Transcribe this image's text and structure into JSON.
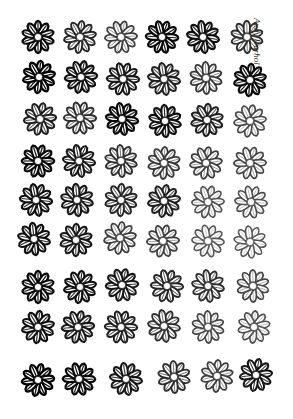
{
  "artwork": {
    "description": "Grid of black-and-white daisy/flower prints of varying ink density",
    "background": "#ffffff",
    "signature": "Andy Warhol",
    "rows": 9,
    "columns": 6,
    "flowers": [
      {
        "row": 0,
        "x": 38,
        "y": 37,
        "ink": 0.95
      },
      {
        "row": 0,
        "x": 80,
        "y": 37,
        "ink": 0.75
      },
      {
        "row": 0,
        "x": 121,
        "y": 37,
        "ink": 0.6
      },
      {
        "row": 0,
        "x": 162,
        "y": 37,
        "ink": 0.95
      },
      {
        "row": 0,
        "x": 203,
        "y": 37,
        "ink": 0.9
      },
      {
        "row": 0,
        "x": 247,
        "y": 37,
        "ink": 0.7
      },
      {
        "row": 1,
        "x": 39,
        "y": 77,
        "ink": 1.0
      },
      {
        "row": 1,
        "x": 81,
        "y": 77,
        "ink": 0.9
      },
      {
        "row": 1,
        "x": 123,
        "y": 79,
        "ink": 0.85
      },
      {
        "row": 1,
        "x": 164,
        "y": 79,
        "ink": 0.8
      },
      {
        "row": 1,
        "x": 206,
        "y": 78,
        "ink": 0.65
      },
      {
        "row": 1,
        "x": 250,
        "y": 80,
        "ink": 0.95
      },
      {
        "row": 2,
        "x": 40,
        "y": 119,
        "ink": 0.8
      },
      {
        "row": 2,
        "x": 80,
        "y": 118,
        "ink": 0.7
      },
      {
        "row": 2,
        "x": 122,
        "y": 119,
        "ink": 0.95
      },
      {
        "row": 2,
        "x": 165,
        "y": 121,
        "ink": 0.9
      },
      {
        "row": 2,
        "x": 207,
        "y": 120,
        "ink": 0.8
      },
      {
        "row": 2,
        "x": 250,
        "y": 121,
        "ink": 0.55
      },
      {
        "row": 3,
        "x": 38,
        "y": 161,
        "ink": 0.95
      },
      {
        "row": 3,
        "x": 79,
        "y": 161,
        "ink": 0.85
      },
      {
        "row": 3,
        "x": 121,
        "y": 161,
        "ink": 0.7
      },
      {
        "row": 3,
        "x": 164,
        "y": 163,
        "ink": 0.65
      },
      {
        "row": 3,
        "x": 206,
        "y": 163,
        "ink": 0.6
      },
      {
        "row": 3,
        "x": 250,
        "y": 163,
        "ink": 0.55
      },
      {
        "row": 4,
        "x": 36,
        "y": 200,
        "ink": 0.9
      },
      {
        "row": 4,
        "x": 77,
        "y": 200,
        "ink": 0.85
      },
      {
        "row": 4,
        "x": 121,
        "y": 200,
        "ink": 0.75
      },
      {
        "row": 4,
        "x": 164,
        "y": 201,
        "ink": 0.8
      },
      {
        "row": 4,
        "x": 208,
        "y": 202,
        "ink": 0.5
      },
      {
        "row": 4,
        "x": 251,
        "y": 202,
        "ink": 0.5
      },
      {
        "row": 5,
        "x": 34,
        "y": 239,
        "ink": 0.9
      },
      {
        "row": 5,
        "x": 76,
        "y": 240,
        "ink": 0.85
      },
      {
        "row": 5,
        "x": 120,
        "y": 238,
        "ink": 0.6
      },
      {
        "row": 5,
        "x": 163,
        "y": 241,
        "ink": 0.6
      },
      {
        "row": 5,
        "x": 208,
        "y": 241,
        "ink": 0.45
      },
      {
        "row": 5,
        "x": 250,
        "y": 242,
        "ink": 0.45
      },
      {
        "row": 6,
        "x": 38,
        "y": 287,
        "ink": 0.95
      },
      {
        "row": 6,
        "x": 80,
        "y": 287,
        "ink": 0.9
      },
      {
        "row": 6,
        "x": 122,
        "y": 285,
        "ink": 0.85
      },
      {
        "row": 6,
        "x": 167,
        "y": 286,
        "ink": 0.75
      },
      {
        "row": 6,
        "x": 208,
        "y": 286,
        "ink": 0.7
      },
      {
        "row": 6,
        "x": 253,
        "y": 286,
        "ink": 0.55
      },
      {
        "row": 7,
        "x": 38,
        "y": 327,
        "ink": 0.9
      },
      {
        "row": 7,
        "x": 78,
        "y": 327,
        "ink": 0.85
      },
      {
        "row": 7,
        "x": 121,
        "y": 327,
        "ink": 0.8
      },
      {
        "row": 7,
        "x": 164,
        "y": 326,
        "ink": 0.7
      },
      {
        "row": 7,
        "x": 208,
        "y": 327,
        "ink": 0.55
      },
      {
        "row": 7,
        "x": 254,
        "y": 327,
        "ink": 0.5
      },
      {
        "row": 8,
        "x": 38,
        "y": 380,
        "ink": 1.0
      },
      {
        "row": 8,
        "x": 79,
        "y": 379,
        "ink": 0.95
      },
      {
        "row": 8,
        "x": 126,
        "y": 379,
        "ink": 0.85
      },
      {
        "row": 8,
        "x": 174,
        "y": 377,
        "ink": 0.7
      },
      {
        "row": 8,
        "x": 217,
        "y": 376,
        "ink": 0.6
      },
      {
        "row": 8,
        "x": 256,
        "y": 375,
        "ink": 0.85
      }
    ]
  }
}
